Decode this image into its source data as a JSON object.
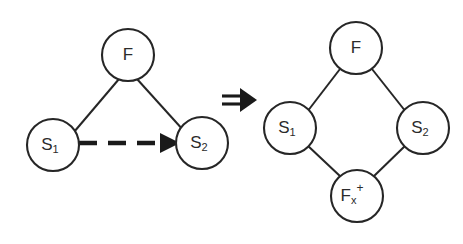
{
  "figure": {
    "background_color": "#ffffff",
    "stroke_color": "#262626",
    "operator": {
      "symbol": "⟹",
      "name": "double-right-arrow-implies",
      "x": 239,
      "y": 100
    },
    "left_graph": {
      "name": "triangle-graph",
      "nodes": [
        {
          "id": "F",
          "label": "F",
          "sub": "",
          "sup": "",
          "cx": 128,
          "cy": 55,
          "r": 26
        },
        {
          "id": "S1",
          "label": "S",
          "sub": "1",
          "sup": "",
          "cx": 53,
          "cy": 145,
          "r": 26
        },
        {
          "id": "S2",
          "label": "S",
          "sub": "2",
          "sup": "",
          "cx": 202,
          "cy": 143,
          "r": 26
        }
      ],
      "edges": [
        {
          "from": "F",
          "to": "S1",
          "style": "solid"
        },
        {
          "from": "F",
          "to": "S2",
          "style": "solid"
        },
        {
          "from": "S1",
          "to": "S2",
          "style": "dashed-arrow"
        }
      ]
    },
    "right_graph": {
      "name": "diamond-graph",
      "nodes": [
        {
          "id": "F",
          "label": "F",
          "sub": "",
          "sup": "",
          "cx": 356,
          "cy": 48,
          "r": 26
        },
        {
          "id": "S1",
          "label": "S",
          "sub": "1",
          "sup": "",
          "cx": 290,
          "cy": 128,
          "r": 26
        },
        {
          "id": "S2",
          "label": "S",
          "sub": "2",
          "sup": "",
          "cx": 423,
          "cy": 128,
          "r": 26
        },
        {
          "id": "Fx+",
          "label": "F",
          "sub": "x",
          "sup": "+",
          "cx": 357,
          "cy": 196,
          "r": 26
        }
      ],
      "edges": [
        {
          "from": "F",
          "to": "S1",
          "style": "solid"
        },
        {
          "from": "F",
          "to": "S2",
          "style": "solid"
        },
        {
          "from": "S1",
          "to": "Fx+",
          "style": "solid"
        },
        {
          "from": "S2",
          "to": "Fx+",
          "style": "solid"
        }
      ]
    }
  }
}
